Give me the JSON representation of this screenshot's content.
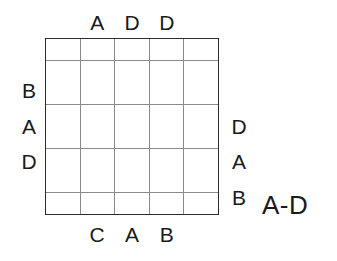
{
  "puzzle": {
    "legend_label": "A-D",
    "grid": {
      "columns": 5,
      "rows": 5,
      "cells": [
        [
          "",
          "",
          "",
          "",
          ""
        ],
        [
          "",
          "",
          "",
          "",
          ""
        ],
        [
          "",
          "",
          "",
          "",
          ""
        ],
        [
          "",
          "",
          "",
          "",
          ""
        ],
        [
          "",
          "",
          "",
          "",
          ""
        ]
      ],
      "border_color": "#2b2b2b",
      "gridline_color": "#8a8a8a",
      "background_color": "#ffffff"
    },
    "clues": {
      "top": [
        "",
        "A",
        "D",
        "D",
        ""
      ],
      "bottom": [
        "",
        "C",
        "A",
        "B",
        ""
      ],
      "left": [
        "",
        "B",
        "A",
        "D",
        ""
      ],
      "right": [
        "",
        "",
        "D",
        "A",
        "B"
      ]
    },
    "text_color": "#1a1a1a"
  }
}
